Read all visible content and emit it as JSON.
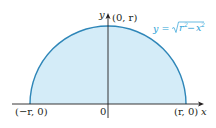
{
  "diagram": {
    "colors": {
      "fill": "#d4ecf8",
      "curve": "#2e86b8",
      "axes": "#231f20",
      "equation": "#2a9fd6"
    },
    "axes": {
      "x_label": "x",
      "y_label": "y",
      "origin_label": "0"
    },
    "points": {
      "left": "(−r, 0)",
      "right": "(r, 0)",
      "top": "(0, r)"
    },
    "equation": {
      "lhs": "y = ",
      "radicand_r": "r",
      "radicand_minus": " − ",
      "radicand_x": "x",
      "exponent": "2"
    }
  }
}
